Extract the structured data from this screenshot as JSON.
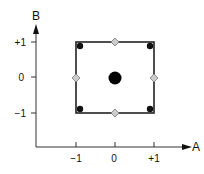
{
  "diagram": {
    "type": "face-centered central composite design",
    "axes": {
      "x": {
        "label": "A",
        "ticks": [
          "-1",
          "0",
          "+1"
        ]
      },
      "y": {
        "label": "B",
        "ticks": [
          "+1",
          "0",
          "-1"
        ]
      }
    },
    "points": {
      "factorial": [
        {
          "A": -1,
          "B": 1
        },
        {
          "A": 1,
          "B": 1
        },
        {
          "A": -1,
          "B": -1
        },
        {
          "A": 1,
          "B": -1
        }
      ],
      "axial": [
        {
          "A": 0,
          "B": 1
        },
        {
          "A": -1,
          "B": 0
        },
        {
          "A": 1,
          "B": 0
        },
        {
          "A": 0,
          "B": -1
        }
      ],
      "center": [
        {
          "A": 0,
          "B": 0
        }
      ]
    },
    "colors": {
      "line": "#222222",
      "factorial_point": "#111111",
      "axial_point_fill": "#cccccc",
      "axial_point_stroke": "#777777",
      "center_point": "#000000"
    }
  }
}
